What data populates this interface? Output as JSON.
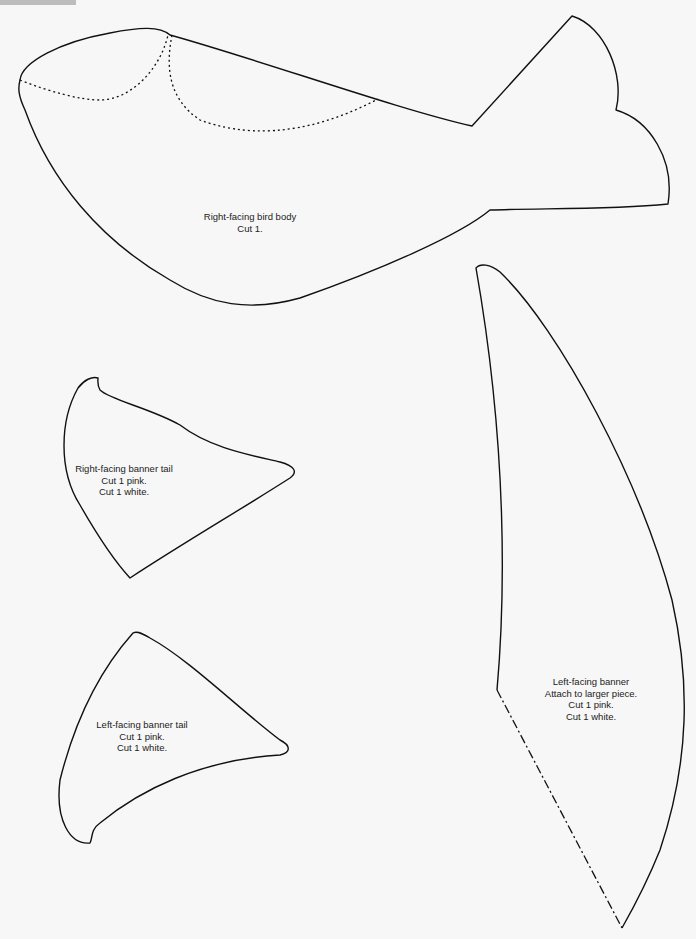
{
  "header": {
    "tab_label": "PATTERNS"
  },
  "pieces": {
    "bird_body": {
      "title": "Right-facing bird body",
      "instructions": [
        "Cut 1."
      ]
    },
    "right_banner_tail": {
      "title": "Right-facing banner tail",
      "instructions": [
        "Cut 1 pink.",
        "Cut 1 white."
      ]
    },
    "left_banner_tail": {
      "title": "Left-facing banner tail",
      "instructions": [
        "Cut 1 pink.",
        "Cut 1 white."
      ]
    },
    "left_banner": {
      "title": "Left-facing banner",
      "instructions": [
        "Attach to larger piece.",
        "Cut 1 pink.",
        "Cut 1 white."
      ]
    }
  },
  "colors": {
    "background": "#f7f7f7",
    "outline": "#111111",
    "tab": "#bdbdbd"
  }
}
